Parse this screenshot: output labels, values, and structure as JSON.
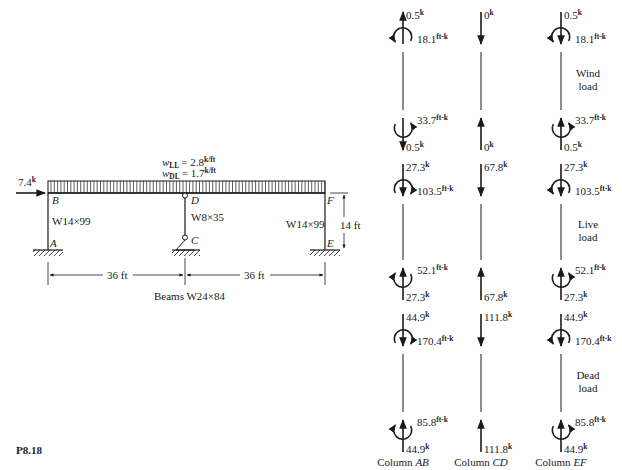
{
  "problem_label": "P8.18",
  "frame": {
    "lateral_load": {
      "value": "7.4",
      "unit": "k"
    },
    "loads": [
      {
        "symbol": "w",
        "sub": "LL",
        "value": "= 2.8",
        "unit": "k/ft"
      },
      {
        "symbol": "w",
        "sub": "DL",
        "value": "= 1.7",
        "unit": "k/ft"
      }
    ],
    "joints": {
      "A": "A",
      "B": "B",
      "C": "C",
      "D": "D",
      "E": "E",
      "F": "F"
    },
    "sections": {
      "col_ab": "W14×99",
      "col_cd": "W8×35",
      "col_ef": "W14×99"
    },
    "height_dim": "14 ft",
    "span_dims": [
      "36 ft",
      "36 ft"
    ],
    "beams_label": "Beams W24×84"
  },
  "free_bodies": {
    "column_labels": [
      {
        "prefix": "Column ",
        "name": "AB"
      },
      {
        "prefix": "Column ",
        "name": "CD"
      },
      {
        "prefix": "Column ",
        "name": "EF"
      }
    ],
    "load_cases": [
      {
        "label_lines": [
          "Wind",
          "load"
        ],
        "columns": [
          {
            "top_force": "0.5",
            "top_moment": "18.1",
            "bottom_moment": "33.7",
            "bottom_force": "0.5",
            "top_dir": "up",
            "bottom_dir": "down"
          },
          {
            "top_force": "0",
            "bottom_force": "0",
            "top_dir": "down",
            "bottom_dir": "up"
          },
          {
            "top_force": "0.5",
            "top_moment": "18.1",
            "bottom_moment": "33.7",
            "bottom_force": "0.5",
            "top_dir": "down",
            "bottom_dir": "up"
          }
        ]
      },
      {
        "label_lines": [
          "Live",
          "load"
        ],
        "columns": [
          {
            "top_force": "27.3",
            "top_moment": "103.5",
            "bottom_moment": "52.1",
            "bottom_force": "27.3",
            "top_dir": "down",
            "bottom_dir": "up"
          },
          {
            "top_force": "67.8",
            "bottom_force": "67.8",
            "top_dir": "down",
            "bottom_dir": "up"
          },
          {
            "top_force": "27.3",
            "top_moment": "103.5",
            "bottom_moment": "52.1",
            "bottom_force": "27.3",
            "top_dir": "down",
            "bottom_dir": "up"
          }
        ]
      },
      {
        "label_lines": [
          "Dead",
          "load"
        ],
        "columns": [
          {
            "top_force": "44.9",
            "top_moment": "170.4",
            "bottom_moment": "85.8",
            "bottom_force": "44.9",
            "top_dir": "down",
            "bottom_dir": "up"
          },
          {
            "top_force": "111.8",
            "bottom_force": "111.8",
            "top_dir": "down",
            "bottom_dir": "up"
          },
          {
            "top_force": "44.9",
            "top_moment": "170.4",
            "bottom_moment": "85.8",
            "bottom_force": "44.9",
            "top_dir": "down",
            "bottom_dir": "up"
          }
        ]
      }
    ],
    "force_unit": "k",
    "moment_unit": "ft-k"
  }
}
